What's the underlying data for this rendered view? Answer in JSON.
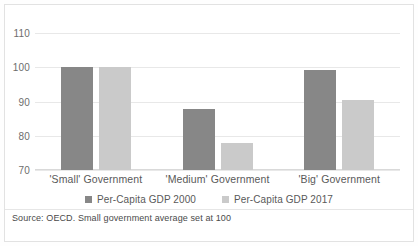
{
  "chart_data": {
    "type": "bar",
    "title": "",
    "subtitle": "",
    "xlabel": "",
    "ylabel": "",
    "categories": [
      "'Small' Government",
      "'Medium' Government",
      "'Big' Government"
    ],
    "series": [
      {
        "name": "Per-Capita GDP 2000",
        "color": "#878787",
        "values": [
          100,
          87.8,
          99.3
        ]
      },
      {
        "name": "Per-Capita GDP 2017",
        "color": "#cacaca",
        "values": [
          100,
          77.8,
          90.5
        ]
      }
    ],
    "ylim": [
      70,
      110
    ],
    "yticks": [
      110,
      100,
      90,
      80,
      70
    ],
    "ytick_labels": [
      "110",
      "100",
      "90",
      "80",
      "70"
    ],
    "grid": true,
    "legend_position": "bottom",
    "source_note": "Source: OECD. Small government average set at 100"
  }
}
